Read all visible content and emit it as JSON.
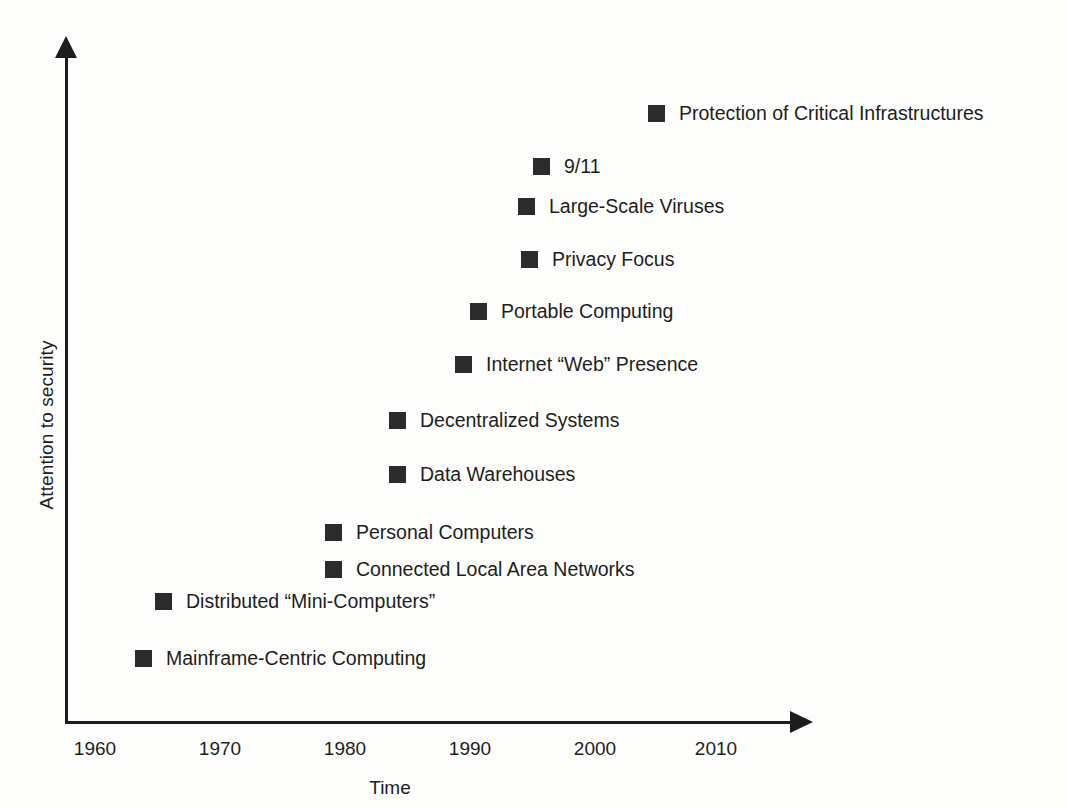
{
  "chart_data": {
    "type": "scatter",
    "title": "",
    "xlabel": "Time",
    "ylabel": "Attention to security",
    "xticks": [
      "1960",
      "1970",
      "1980",
      "1990",
      "2000",
      "2010"
    ],
    "xlim": [
      1960,
      2013
    ],
    "yticks": [],
    "grid": false,
    "legend": "none",
    "marker_color": "#2b2b2b",
    "axis_color": "#1c1c1c",
    "points": [
      {
        "label": "Protection of Critical Infrastructures",
        "x": 2005,
        "y": 12,
        "px": 648,
        "py": 104
      },
      {
        "label": "9/11",
        "x": 1996,
        "y": 11,
        "px": 533,
        "py": 157
      },
      {
        "label": "Large-Scale Viruses",
        "x": 1994,
        "y": 10,
        "px": 518,
        "py": 197
      },
      {
        "label": "Privacy Focus",
        "x": 1995,
        "y": 9,
        "px": 521,
        "py": 250
      },
      {
        "label": "Portable Computing",
        "x": 1991,
        "y": 8,
        "px": 470,
        "py": 302
      },
      {
        "label": "Internet “Web” Presence",
        "x": 1989,
        "y": 7,
        "px": 455,
        "py": 355
      },
      {
        "label": "Decentralized Systems",
        "x": 1984,
        "y": 6,
        "px": 389,
        "py": 411
      },
      {
        "label": "Data Warehouses",
        "x": 1984,
        "y": 5,
        "px": 389,
        "py": 465
      },
      {
        "label": "Personal Computers",
        "x": 1979,
        "y": 4,
        "px": 325,
        "py": 523
      },
      {
        "label": "Connected Local Area Networks",
        "x": 1979,
        "y": 3,
        "px": 325,
        "py": 560
      },
      {
        "label": "Distributed “Mini-Computers”",
        "x": 1965,
        "y": 2,
        "px": 155,
        "py": 592
      },
      {
        "label": "Mainframe-Centric Computing",
        "x": 1964,
        "y": 1,
        "px": 135,
        "py": 649
      }
    ]
  },
  "axes": {
    "x_title": "Time",
    "y_title": "Attention to security",
    "x_tick_positions": [
      95,
      220,
      345,
      470,
      595,
      716
    ]
  }
}
